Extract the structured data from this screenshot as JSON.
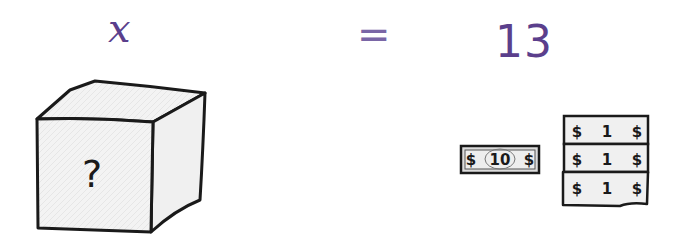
{
  "equation": {
    "left_side": "x",
    "operator": "=",
    "right_side": "13"
  },
  "mystery_box": {
    "symbol": "?"
  },
  "money": {
    "ten_bill": {
      "left": "$",
      "value": "10",
      "right": "$"
    },
    "one_bills": [
      {
        "left": "$",
        "value": "1",
        "right": "$"
      },
      {
        "left": "$",
        "value": "1",
        "right": "$"
      },
      {
        "left": "$",
        "value": "1",
        "right": "$"
      }
    ]
  },
  "colors": {
    "accent_purple": "#5b3f8c",
    "ink": "#1a1a1a",
    "paper_fill": "#f1f1f1"
  }
}
